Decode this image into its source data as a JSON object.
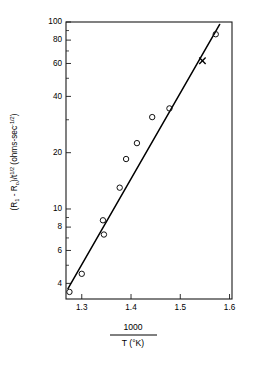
{
  "chart_data": {
    "type": "scatter",
    "title": "",
    "subtitle": "",
    "xlabel_numerator": "1000",
    "xlabel_denominator": "T (°K)",
    "xlabel": "1000 / T (°K)",
    "ylabel": "(R₁ - R₀)/t^(1/2)  (ohms-sec^(-1/2))",
    "ylabel_parts": {
      "main_open": "(R",
      "main_sub1": "1",
      "main_mid": " - R",
      "main_sub2": "o",
      "main_close": ")/t",
      "main_exp": "1/2",
      "units_open": " (ohms-sec",
      "units_exp": "-1/2",
      "units_close": ")"
    },
    "xscale": "linear",
    "yscale": "log",
    "xlim": [
      1.268,
      1.605
    ],
    "ylim": [
      3.3,
      100
    ],
    "grid": false,
    "legend": "none",
    "xticks": [
      1.3,
      1.4,
      1.5,
      1.6
    ],
    "xticklabels": [
      "1.3",
      "1.4",
      "1.5",
      "1.6"
    ],
    "yticks": [
      4,
      6,
      8,
      10,
      20,
      40,
      60,
      80,
      100
    ],
    "yticklabels": [
      "4",
      "6",
      "8",
      "10",
      "20",
      "40",
      "60",
      "80",
      "100"
    ],
    "yminorticks": [
      5,
      7,
      9,
      30,
      50,
      70,
      90
    ],
    "series": [
      {
        "name": "data",
        "marker": "open-circle",
        "points": [
          {
            "x": 1.275,
            "y": 3.6
          },
          {
            "x": 1.3,
            "y": 4.5
          },
          {
            "x": 1.345,
            "y": 7.3
          },
          {
            "x": 1.343,
            "y": 8.7
          },
          {
            "x": 1.377,
            "y": 13.0
          },
          {
            "x": 1.39,
            "y": 18.5
          },
          {
            "x": 1.412,
            "y": 22.5
          },
          {
            "x": 1.443,
            "y": 31.0
          },
          {
            "x": 1.478,
            "y": 34.5
          },
          {
            "x": 1.572,
            "y": 86.0
          }
        ]
      },
      {
        "name": "outlier",
        "marker": "x-cross",
        "points": [
          {
            "x": 1.545,
            "y": 62.0
          }
        ]
      }
    ],
    "fit_line": {
      "type": "line",
      "x_start": 1.272,
      "y_start": 3.75,
      "x_end": 1.58,
      "y_end": 97.0
    }
  }
}
